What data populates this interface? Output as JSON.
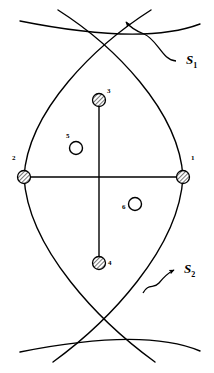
{
  "figure": {
    "background_color": "#ffffff",
    "stroke_color": "#000000",
    "canvas": {
      "width": 214,
      "height": 373
    }
  },
  "surfaces": [
    {
      "id": "S1",
      "label": "S",
      "subscript": "1",
      "label_x": 186,
      "label_y": 62,
      "description": "upper arc leader line with arrowhead"
    },
    {
      "id": "S2",
      "label": "S",
      "subscript": "2",
      "label_x": 184,
      "label_y": 271,
      "description": "lower arc leader line with arrowhead"
    }
  ],
  "nodes": [
    {
      "id": 1,
      "label": "1",
      "type": "hatched-circle",
      "cx": 183,
      "cy": 177,
      "r": 6.5,
      "label_x": 191,
      "label_y": 160
    },
    {
      "id": 2,
      "label": "2",
      "type": "hatched-circle",
      "cx": 24,
      "cy": 177,
      "r": 6.5,
      "label_x": 12,
      "label_y": 160
    },
    {
      "id": 3,
      "label": "3",
      "type": "hatched-circle",
      "cx": 99,
      "cy": 100,
      "r": 6.5,
      "label_x": 107,
      "label_y": 91
    },
    {
      "id": 4,
      "label": "4",
      "type": "hatched-circle",
      "cx": 99,
      "cy": 263,
      "r": 6.5,
      "label_x": 108,
      "label_y": 261
    },
    {
      "id": 5,
      "label": "5",
      "type": "open-circle",
      "cx": 76,
      "cy": 148,
      "r": 6.5,
      "label_x": 66,
      "label_y": 135
    },
    {
      "id": 6,
      "label": "6",
      "type": "open-circle",
      "cx": 135,
      "cy": 204,
      "r": 6.5,
      "label_x": 122,
      "label_y": 204
    }
  ],
  "connectors": [
    {
      "id": "horizontal-axis",
      "from": 2,
      "to": 1,
      "x1": 24,
      "y1": 177,
      "x2": 183,
      "y2": 177
    },
    {
      "id": "vertical-axis",
      "from": 3,
      "to": 4,
      "x1": 99,
      "y1": 100,
      "x2": 99,
      "y2": 263
    }
  ]
}
